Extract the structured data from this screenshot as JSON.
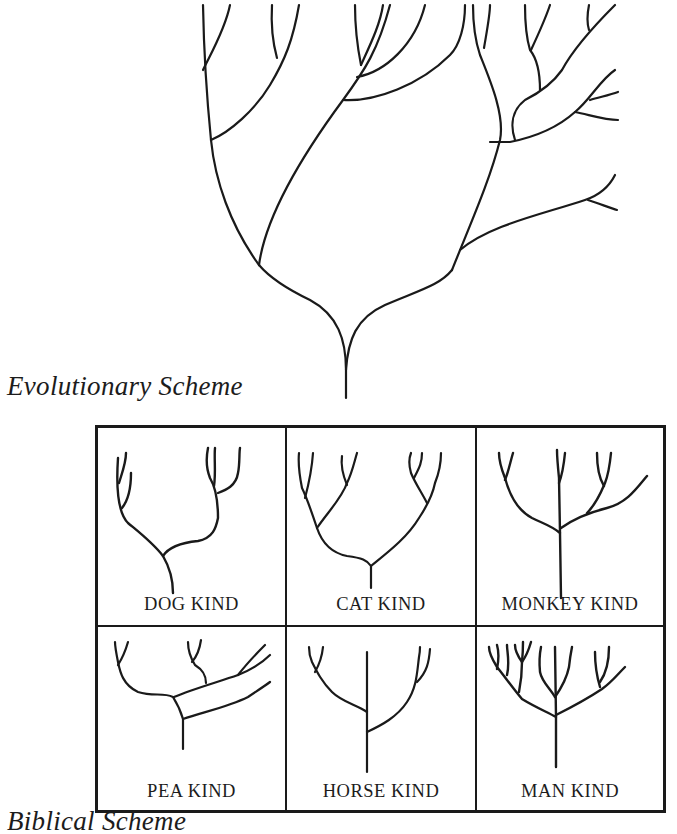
{
  "captions": {
    "evolutionary": "Evolutionary Scheme",
    "biblical": "Biblical Scheme"
  },
  "kinds": [
    {
      "label": "DOG KIND"
    },
    {
      "label": "CAT KIND"
    },
    {
      "label": "MONKEY KIND"
    },
    {
      "label": "PEA KIND"
    },
    {
      "label": "HORSE KIND"
    },
    {
      "label": "MAN KIND"
    }
  ],
  "colors": {
    "ink": "#1a1a1a",
    "background": "#ffffff"
  }
}
